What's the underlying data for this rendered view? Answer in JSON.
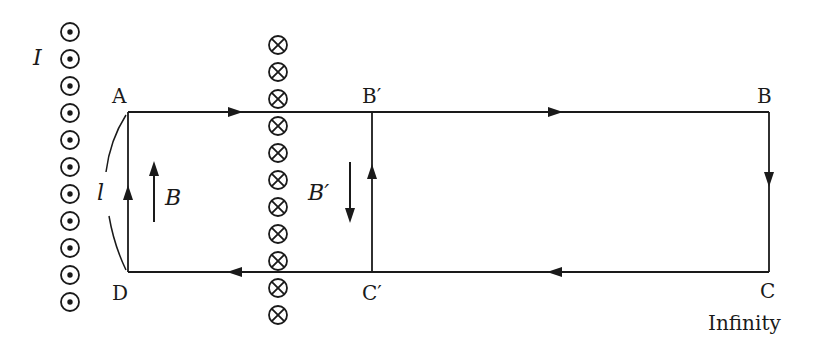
{
  "diagram": {
    "type": "current-loop-magnetic-field",
    "colors": {
      "ink": "#1a1a1a",
      "background": "#ffffff"
    },
    "wires": {
      "left_wire": {
        "label": "I",
        "symbol": "dot-circle",
        "direction": "out-of-page",
        "count": 11
      },
      "middle_wire": {
        "symbol": "cross-circle",
        "direction": "into-page",
        "count": 11
      }
    },
    "points": {
      "A": "A",
      "B_prime": "B′",
      "B": "B",
      "C": "C",
      "C_prime": "C′",
      "D": "D"
    },
    "labels": {
      "length": "l",
      "field_B": "B",
      "field_B_prime": "B′",
      "infinity": "Infinity",
      "current": "I"
    },
    "paths": [
      {
        "segment": "A→B",
        "arrow": "right"
      },
      {
        "segment": "B→C",
        "arrow": "down"
      },
      {
        "segment": "C→D",
        "arrow": "left"
      },
      {
        "segment": "D→A",
        "arrow": "up"
      },
      {
        "segment": "C′→B′",
        "arrow": "up"
      }
    ],
    "field_arrows": [
      {
        "label": "B",
        "direction": "up"
      },
      {
        "label": "B′",
        "direction": "down"
      }
    ]
  }
}
